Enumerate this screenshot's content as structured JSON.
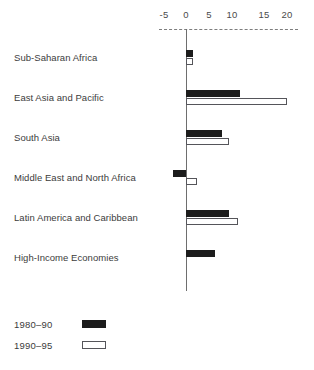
{
  "chart_data": {
    "type": "bar",
    "orientation": "horizontal",
    "title": "",
    "subtitle": "",
    "xlabel": "",
    "ylabel": "",
    "xlim": [
      -5,
      20
    ],
    "xticks": [
      -5,
      0,
      5,
      10,
      15,
      20
    ],
    "xtick_labels": [
      "-5",
      "0",
      "5",
      "10",
      "15",
      "20"
    ],
    "grid": false,
    "axis_style": "dashed-top-axis-with-zero-line",
    "legend_position": "bottom-left",
    "categories": [
      "Sub-Saharan Africa",
      "East Asia and Pacific",
      "South Asia",
      "Middle East and North Africa",
      "Latin America and Caribbean",
      "High-Income Economies"
    ],
    "series": [
      {
        "name": "1980-90",
        "color": "#1c1c1c",
        "fill": "solid",
        "values": [
          1.5,
          12.0,
          8.0,
          -3.0,
          9.5,
          6.5
        ]
      },
      {
        "name": "1990-95",
        "color": "#ffffff",
        "fill": "outline",
        "values": [
          1.5,
          22.5,
          9.5,
          2.5,
          11.5,
          0.0
        ]
      }
    ]
  },
  "legend": {
    "items": [
      {
        "label": "1980–90",
        "style": "black"
      },
      {
        "label": "1990–95",
        "style": "white"
      }
    ]
  },
  "colors": {
    "series_1980_90": "#1c1c1c",
    "series_1990_95": "#ffffff",
    "outline": "#55555a",
    "axis": "#6e6e6e",
    "text": "#3c3c3c",
    "background": "#ffffff"
  }
}
